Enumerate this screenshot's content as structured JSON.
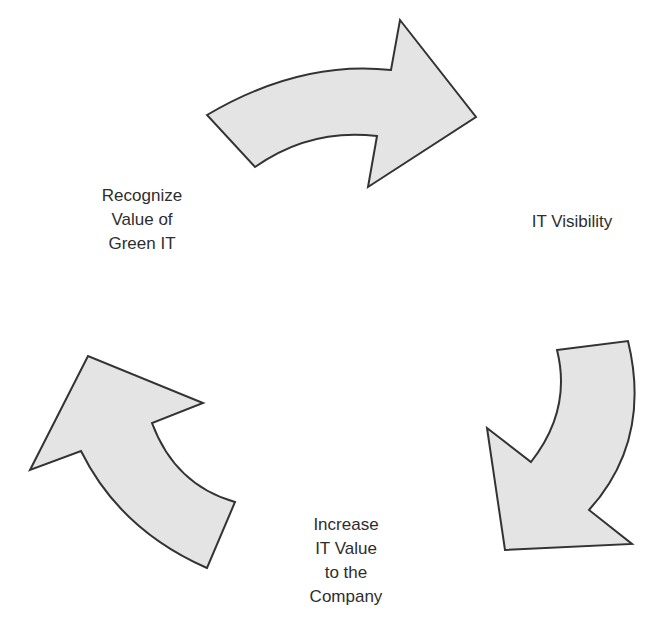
{
  "diagram": {
    "type": "cycle",
    "direction": "clockwise",
    "colors": {
      "arrow_fill": "#e4e4e4",
      "arrow_stroke": "#333333",
      "text": "#2e2e2e"
    },
    "nodes": [
      {
        "id": "recognize",
        "lines": [
          "Recognize",
          "Value of",
          "Green IT"
        ]
      },
      {
        "id": "visibility",
        "lines": [
          "IT Visibility"
        ]
      },
      {
        "id": "increase",
        "lines": [
          "Increase",
          "IT Value",
          "to the",
          "Company"
        ]
      }
    ],
    "edges": [
      {
        "from": "recognize",
        "to": "visibility",
        "icon": "curved-arrow-right"
      },
      {
        "from": "visibility",
        "to": "increase",
        "icon": "curved-arrow-down"
      },
      {
        "from": "increase",
        "to": "recognize",
        "icon": "curved-arrow-up"
      }
    ]
  }
}
